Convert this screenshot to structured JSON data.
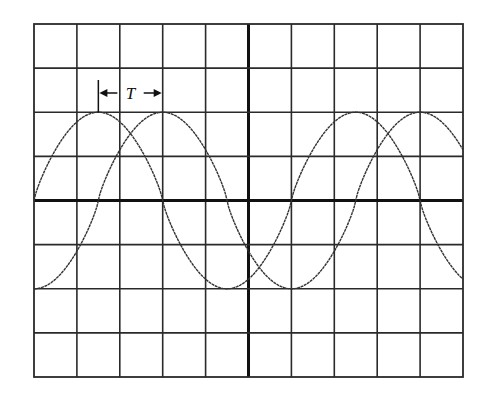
{
  "figure": {
    "type": "oscilloscope-display",
    "grid": {
      "divisions_x": 10,
      "divisions_y": 8,
      "left_px": 34,
      "right_px": 463,
      "top_px": 24,
      "bottom_px": 377
    },
    "annotation": {
      "label": "T",
      "from_div": 1.5,
      "to_div": 3.0,
      "meaning": "time offset between the two waveform peaks"
    }
  },
  "chart_data": {
    "type": "line",
    "title": "",
    "xlabel": "",
    "ylabel": "",
    "xlim": [
      0,
      10
    ],
    "ylim": [
      -4,
      4
    ],
    "grid": true,
    "units": "divisions",
    "series": [
      {
        "name": "waveform-a",
        "shape": "sine",
        "amplitude_div": 2,
        "period_div": 6,
        "phase_div": 0,
        "key_points": [
          [
            0,
            0
          ],
          [
            1.5,
            2
          ],
          [
            3,
            0
          ],
          [
            4.5,
            -2
          ],
          [
            6,
            0
          ],
          [
            7.5,
            2
          ],
          [
            9,
            0
          ],
          [
            10,
            -1.7
          ]
        ]
      },
      {
        "name": "waveform-b",
        "shape": "sine",
        "amplitude_div": 2,
        "period_div": 6,
        "phase_div": 1.5,
        "key_points": [
          [
            0,
            -2
          ],
          [
            1.5,
            0
          ],
          [
            3,
            2
          ],
          [
            4.5,
            0
          ],
          [
            6,
            -2
          ],
          [
            7.5,
            0
          ],
          [
            9,
            2
          ],
          [
            10,
            1
          ]
        ]
      }
    ]
  }
}
